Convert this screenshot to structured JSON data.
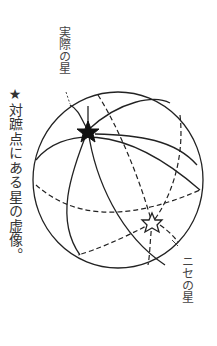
{
  "diagram": {
    "caption": "★対蹠点にある星の虚像。",
    "labels": {
      "real_star": "実際の星",
      "fake_star": "ニセの星"
    },
    "colors": {
      "line": "#222222",
      "background": "#ffffff"
    },
    "elements": {
      "sphere": "celestial-sphere",
      "real_star_marker": "filled-star",
      "fake_star_marker": "hollow-star"
    }
  }
}
